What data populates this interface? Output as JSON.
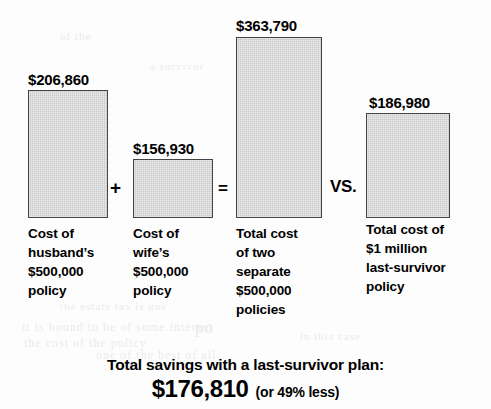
{
  "chart_data": {
    "type": "bar",
    "title": "",
    "subtitle": "",
    "xlabel": "",
    "ylabel": "",
    "grid": false,
    "legend": false,
    "axis_visible": false,
    "ylim": [
      0,
      363790
    ],
    "baseline_y_px": 218,
    "categories": [
      "Cost of husband’s $500,000 policy",
      "Cost of wife’s $500,000 policy",
      "Total cost of two separate $500,000 policies",
      "Total cost of $1 million last-survivor policy"
    ],
    "values": [
      206860,
      156930,
      363790,
      186980
    ],
    "value_labels": [
      "$206,860",
      "$156,930",
      "$363,790",
      "$186,980"
    ],
    "bar_color": "#c9c9c9",
    "bar_border_color": "#444444",
    "background_color": "#fdfdfd",
    "annotations": [
      {
        "text": "+",
        "between": [
          0,
          1
        ]
      },
      {
        "text": "=",
        "between": [
          1,
          2
        ]
      },
      {
        "text": "VS.",
        "between": [
          2,
          3
        ]
      }
    ]
  },
  "bars": [
    {
      "name": "husband-policy",
      "value_label": "$206,860",
      "caption": "Cost of\nhusband’s\n$500,000\npolicy",
      "x": 28,
      "y": 90,
      "w": 80,
      "h": 128,
      "label_x": 28,
      "label_y": 72,
      "caption_x": 28,
      "caption_y": 224,
      "caption_w": 104
    },
    {
      "name": "wife-policy",
      "value_label": "$156,930",
      "caption": "Cost of\nwife’s\n$500,000\npolicy",
      "x": 133,
      "y": 159,
      "w": 80,
      "h": 59,
      "label_x": 133,
      "label_y": 141,
      "caption_x": 133,
      "caption_y": 224,
      "caption_w": 100
    },
    {
      "name": "two-separate-policies",
      "value_label": "$363,790",
      "caption": "Total cost\nof two\nseparate\n$500,000\npolicies",
      "x": 236,
      "y": 37,
      "w": 86,
      "h": 181,
      "label_x": 236,
      "label_y": 18,
      "caption_x": 236,
      "caption_y": 224,
      "caption_w": 110
    },
    {
      "name": "last-survivor-policy",
      "value_label": "$186,980",
      "caption": "Total cost of\n$1 million\nlast-survivor\npolicy",
      "x": 366,
      "y": 113,
      "w": 84,
      "h": 105,
      "label_x": 369,
      "label_y": 95,
      "caption_x": 366,
      "caption_y": 220,
      "caption_w": 125
    }
  ],
  "operators": [
    {
      "name": "plus",
      "text": "+",
      "x": 110,
      "y": 178
    },
    {
      "name": "equals",
      "text": "=",
      "x": 218,
      "y": 180
    },
    {
      "name": "versus",
      "text": "VS.",
      "x": 330,
      "y": 178
    }
  ],
  "summary": {
    "headline": "Total savings with a last-survivor plan:",
    "amount": "$176,810",
    "note": "(or 49% less)"
  },
  "ghost_text": [
    {
      "text": "po",
      "x": 195,
      "y": 318,
      "size": 17
    },
    {
      "text": "it is bound to be of some interest",
      "x": 22,
      "y": 320,
      "size": 12
    },
    {
      "text": "the cost of the policy",
      "x": 24,
      "y": 336,
      "size": 12
    },
    {
      "text": "one of the best of all",
      "x": 96,
      "y": 348,
      "size": 12
    },
    {
      "text": "the estate tax is due",
      "x": 60,
      "y": 300,
      "size": 11
    },
    {
      "text": "in this case",
      "x": 300,
      "y": 330,
      "size": 11
    },
    {
      "text": "a survivor",
      "x": 150,
      "y": 60,
      "size": 11
    },
    {
      "text": "of the",
      "x": 60,
      "y": 30,
      "size": 11
    }
  ]
}
